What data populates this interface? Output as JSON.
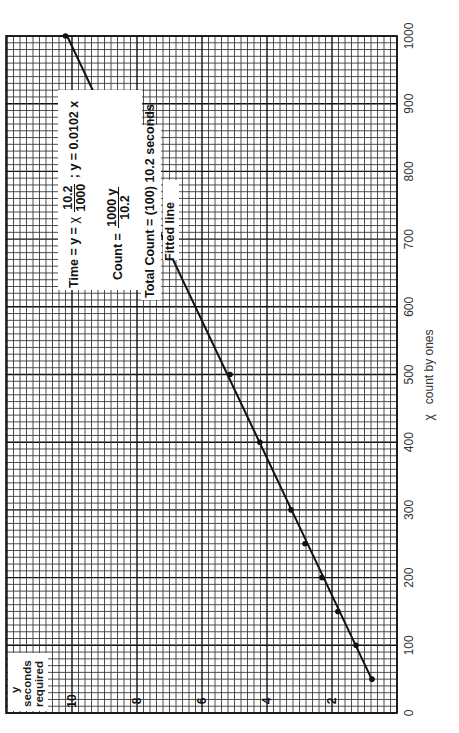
{
  "chart_data": {
    "type": "scatter",
    "title": "",
    "orientation_note": "page rotated 90 degrees counter-clockwise",
    "xlabel": "count by ones",
    "xlabel_symbol": "χ",
    "ylabel_lines": [
      "y",
      "seconds",
      "required"
    ],
    "xlim": [
      0,
      1000
    ],
    "ylim": [
      0,
      12
    ],
    "x_ticks": [
      "0",
      "100",
      "200",
      "300",
      "400",
      "500",
      "600",
      "700",
      "800",
      "900",
      "1000"
    ],
    "y_ticks": [
      "2",
      "4",
      "6",
      "8",
      "10"
    ],
    "grid": true,
    "grid_minor_per_major": 10,
    "series": [
      {
        "name": "measured",
        "x": [
          50,
          100,
          150,
          200,
          250,
          300,
          400,
          500,
          800,
          1000
        ],
        "y": [
          0.77,
          1.26,
          1.82,
          2.31,
          2.83,
          3.26,
          4.22,
          5.14,
          8.3,
          10.2
        ]
      },
      {
        "name": "Fitted line",
        "type": "line",
        "x": [
          47,
          1000
        ],
        "y": [
          0.75,
          10.15
        ]
      }
    ],
    "annotations": [
      "Fitted line",
      "Total Count = (100) 10.2 seconds",
      "Count = 1000 y / 10.2",
      "Time = y = χ 10.2/1000 ; y = 0.0102 x"
    ]
  },
  "labels": {
    "x_axis": {
      "symbol": "χ",
      "text": "count by ones"
    },
    "y_axis": {
      "line1": "y",
      "line2": "seconds",
      "line3": "required"
    },
    "x_ticks": [
      "0",
      "100",
      "200",
      "300",
      "400",
      "500",
      "600",
      "700",
      "800",
      "900",
      "1000"
    ],
    "y_ticks": [
      "2",
      "4",
      "6",
      "8",
      "10"
    ]
  },
  "annotation": {
    "fitted_line": "Fitted line",
    "total_count": "Total Count = (100) 10.2 seconds",
    "count_prefix": "Count = ",
    "count_num": "1000 y",
    "count_den": "10.2",
    "time_prefix": "Time = y = ",
    "time_chi": "χ",
    "time_num": "10.2",
    "time_den": "1000",
    "time_suffix": "; y = 0.0102 x"
  },
  "colors": {
    "grid_minor": "#3a3a3a",
    "grid_major": "#111111",
    "line": "#111111",
    "paper": "#ffffff"
  }
}
